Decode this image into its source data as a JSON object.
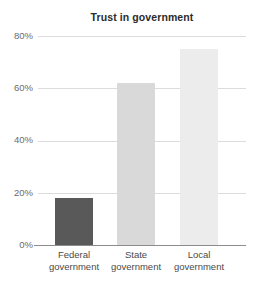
{
  "chart_data": {
    "type": "bar",
    "title": "Trust in government",
    "subtitle": "",
    "xlabel": "",
    "ylabel": "",
    "categories": [
      "Federal government",
      "State government",
      "Local government"
    ],
    "category_lines": [
      [
        "Federal",
        "government"
      ],
      [
        "State",
        "government"
      ],
      [
        "Local",
        "government"
      ]
    ],
    "values": [
      18,
      62,
      75
    ],
    "value_labels": [
      "18%",
      "62%",
      "75%"
    ],
    "ylim": [
      0,
      80
    ],
    "yticks": [
      0,
      20,
      40,
      60,
      80
    ],
    "ytick_labels": [
      "0%",
      "20%",
      "40%",
      "60%",
      "80%"
    ],
    "grid": true,
    "grid_axis": "y",
    "legend": false,
    "legend_position": "none",
    "bar_colors": [
      "#595959",
      "#d9d9d9",
      "#ececec"
    ],
    "grid_color": "#dcdcdc",
    "axis_color": "#8c8c8c",
    "title_color": "#2b2b2b",
    "tick_label_color": "#6b6b6b",
    "category_label_color": "#4a4a4a",
    "background_color": "#ffffff"
  }
}
